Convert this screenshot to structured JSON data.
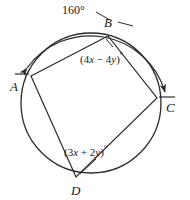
{
  "figure": {
    "type": "circle-with-inscribed-quadrilateral",
    "stroke_color": "#2b2b2b",
    "background_color": "#ffffff",
    "circle": {
      "cx": 91,
      "cy": 103,
      "r": 70
    },
    "vertices": [
      {
        "name": "A",
        "label": "A",
        "x": 31,
        "y": 76,
        "label_x": 10,
        "label_y": 80,
        "tick": true
      },
      {
        "name": "B",
        "label": "B",
        "x": 108,
        "y": 36,
        "label_x": 104,
        "label_y": 16,
        "tick": false
      },
      {
        "name": "C",
        "label": "C",
        "x": 157,
        "y": 98,
        "label_x": 166,
        "label_y": 101,
        "tick": true
      },
      {
        "name": "D",
        "label": "D",
        "x": 76,
        "y": 177,
        "label_x": 71,
        "label_y": 184,
        "tick": false
      }
    ],
    "arc_measure": {
      "value": "160",
      "degree_symbol": "°",
      "label": "160°",
      "label_x": 62,
      "label_y": 4,
      "from_vertex": "A",
      "to_vertex": "C",
      "direction": "clockwise-over-B",
      "double_headed": true
    },
    "angle_labels": [
      {
        "name": "angle-at-B",
        "open_paren": "(",
        "coef1": "4",
        "var1": "x",
        "operator": "−",
        "coef2": "4",
        "var2": "y",
        "close_paren": ")",
        "degree_symbol": "°",
        "text": "(4x − 4y)°",
        "label_x": 80,
        "label_y": 52,
        "points_to": "B"
      },
      {
        "name": "angle-at-D",
        "open_paren": "(",
        "coef1": "3",
        "var1": "x",
        "operator": "+",
        "coef2": "2",
        "var2": "y",
        "close_paren": ")",
        "degree_symbol": "°",
        "text": "(3x + 2y)°",
        "label_x": 64,
        "label_y": 145,
        "points_to": "D"
      }
    ]
  }
}
